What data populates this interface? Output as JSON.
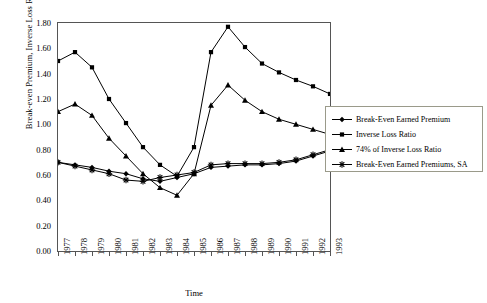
{
  "chart_data": {
    "type": "line",
    "title": "",
    "xlabel": "Time",
    "ylabel": "Break-even Premium, Inverse Loss Ratio",
    "grid": false,
    "legend_position": "right",
    "xlim": [
      1977,
      1993
    ],
    "ylim": [
      0.0,
      1.8
    ],
    "ytick_labels": [
      "0.00",
      "0.20",
      "0.40",
      "0.60",
      "0.80",
      "1.00",
      "1.20",
      "1.40",
      "1.60",
      "1.80"
    ],
    "ytick_values": [
      0.0,
      0.2,
      0.4,
      0.6,
      0.8,
      1.0,
      1.2,
      1.4,
      1.6,
      1.8
    ],
    "categories": [
      "1977",
      "1978",
      "1979",
      "1980",
      "1981",
      "1982",
      "1983",
      "1984",
      "1985",
      "1986",
      "1987",
      "1988",
      "1989",
      "1990",
      "1991",
      "1992",
      "1993"
    ],
    "x": [
      1977,
      1978,
      1979,
      1980,
      1981,
      1982,
      1983,
      1984,
      1985,
      1986,
      1987,
      1988,
      1989,
      1990,
      1991,
      1992,
      1993
    ],
    "series": [
      {
        "name": "Break-Even Earned Premium",
        "marker": "diamond",
        "values": [
          0.7,
          0.68,
          0.66,
          0.63,
          0.61,
          0.57,
          0.55,
          0.58,
          0.61,
          0.66,
          0.67,
          0.68,
          0.68,
          0.69,
          0.71,
          0.75,
          0.79
        ]
      },
      {
        "name": "Inverse Loss Ratio",
        "marker": "square",
        "values": [
          1.5,
          1.57,
          1.45,
          1.2,
          1.01,
          0.82,
          0.68,
          0.59,
          0.82,
          1.57,
          1.77,
          1.61,
          1.48,
          1.41,
          1.35,
          1.3,
          1.24
        ]
      },
      {
        "name": "74% of Inverse Loss Ratio",
        "marker": "triangle",
        "values": [
          1.1,
          1.16,
          1.07,
          0.89,
          0.75,
          0.61,
          0.5,
          0.44,
          0.61,
          1.15,
          1.31,
          1.19,
          1.1,
          1.04,
          1.0,
          0.96,
          0.92
        ]
      },
      {
        "name": "Break-Even Earned Premiums, SA",
        "marker": "star",
        "values": [
          0.7,
          0.67,
          0.64,
          0.61,
          0.56,
          0.55,
          0.58,
          0.6,
          0.62,
          0.68,
          0.69,
          0.69,
          0.69,
          0.7,
          0.72,
          0.76,
          0.8
        ]
      }
    ]
  },
  "legend": {
    "items": [
      {
        "label": "Break-Even Earned Premium",
        "marker": "diamond"
      },
      {
        "label": "Inverse Loss Ratio",
        "marker": "square"
      },
      {
        "label": "74% of Inverse Loss Ratio",
        "marker": "triangle"
      },
      {
        "label": "Break-Even Earned Premiums, SA",
        "marker": "star"
      }
    ]
  },
  "axis": {
    "x_title": "Time",
    "y_title": "Break-even Premium, Inverse Loss Ratio"
  },
  "colors": {
    "line": "#000000",
    "frame": "#555555",
    "legend_border": "#9a9a8a",
    "background": "#ffffff"
  }
}
